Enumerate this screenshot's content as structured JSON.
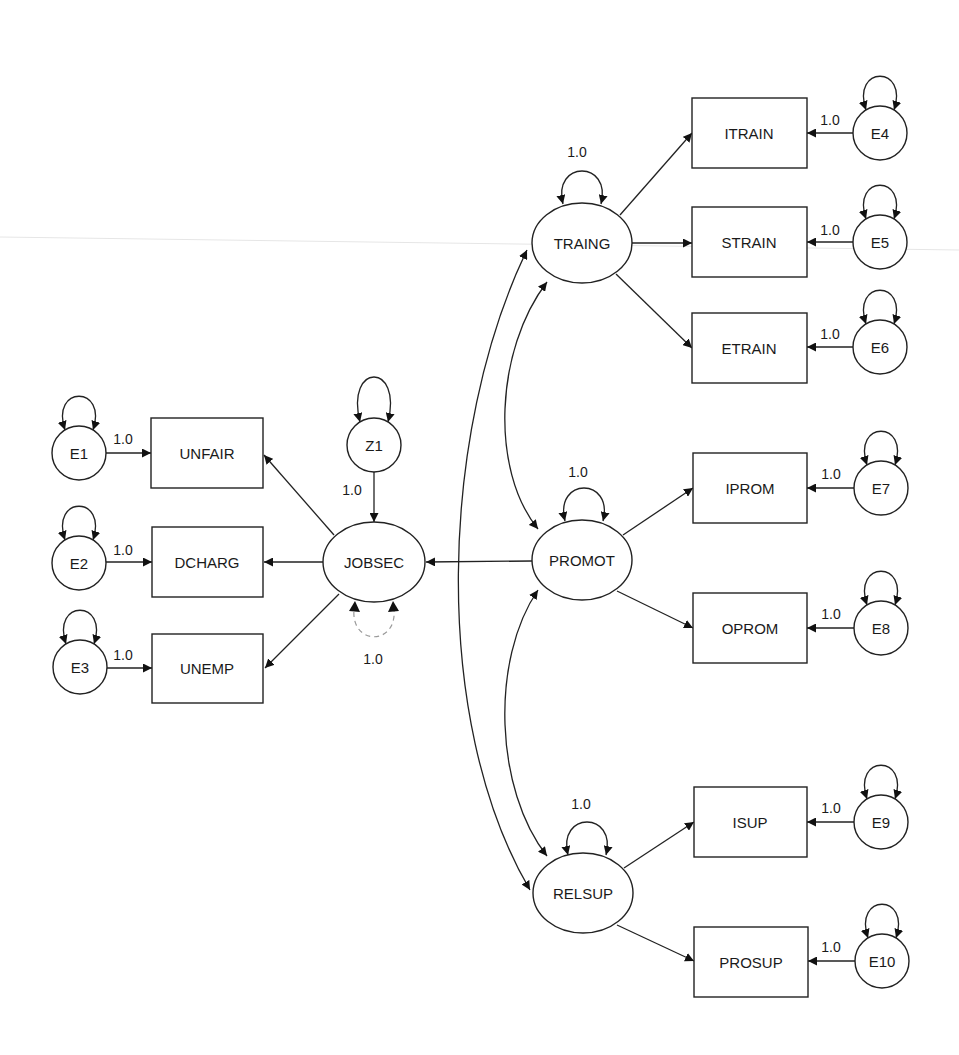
{
  "diagram": {
    "type": "structural-equation-model",
    "colors": {
      "stroke": "#222222",
      "dashed": "#9a9a9a",
      "background": "#ffffff"
    },
    "latent_factors": [
      {
        "id": "JOBSEC",
        "label": "JOBSEC",
        "cx": 374,
        "cy": 562,
        "rx": 51,
        "ry": 40
      },
      {
        "id": "TRAING",
        "label": "TRAING",
        "cx": 582,
        "cy": 243,
        "rx": 50,
        "ry": 40
      },
      {
        "id": "PROMOT",
        "label": "PROMOT",
        "cx": 582,
        "cy": 560,
        "rx": 50,
        "ry": 40
      },
      {
        "id": "RELSUP",
        "label": "RELSUP",
        "cx": 583,
        "cy": 893,
        "rx": 50,
        "ry": 40
      }
    ],
    "indicators": [
      {
        "id": "UNFAIR",
        "label": "UNFAIR",
        "x": 151,
        "y": 418,
        "w": 112,
        "h": 70
      },
      {
        "id": "DCHARG",
        "label": "DCHARG",
        "x": 152,
        "y": 527,
        "w": 111,
        "h": 70
      },
      {
        "id": "UNEMP",
        "label": "UNEMP",
        "x": 152,
        "y": 634,
        "w": 111,
        "h": 69
      },
      {
        "id": "ITRAIN",
        "label": "ITRAIN",
        "x": 692,
        "y": 98,
        "w": 115,
        "h": 70
      },
      {
        "id": "STRAIN",
        "label": "STRAIN",
        "x": 692,
        "y": 207,
        "w": 115,
        "h": 70
      },
      {
        "id": "ETRAIN",
        "label": "ETRAIN",
        "x": 692,
        "y": 313,
        "w": 115,
        "h": 70
      },
      {
        "id": "IPROM",
        "label": "IPROM",
        "x": 693,
        "y": 453,
        "w": 114,
        "h": 70
      },
      {
        "id": "OPROM",
        "label": "OPROM",
        "x": 693,
        "y": 593,
        "w": 114,
        "h": 70
      },
      {
        "id": "ISUP",
        "label": "ISUP",
        "x": 694,
        "y": 787,
        "w": 113,
        "h": 70
      },
      {
        "id": "PROSUP",
        "label": "PROSUP",
        "x": 694,
        "y": 927,
        "w": 114,
        "h": 70
      }
    ],
    "errors": [
      {
        "id": "E1",
        "label": "E1",
        "cx": 79,
        "cy": 453,
        "r": 27,
        "target": "UNFAIR",
        "weight": "1.0"
      },
      {
        "id": "E2",
        "label": "E2",
        "cx": 79,
        "cy": 563,
        "r": 27,
        "target": "DCHARG",
        "weight": "1.0"
      },
      {
        "id": "E3",
        "label": "E3",
        "cx": 80,
        "cy": 667,
        "r": 27,
        "target": "UNEMP",
        "weight": "1.0"
      },
      {
        "id": "E4",
        "label": "E4",
        "cx": 880,
        "cy": 133,
        "r": 27,
        "target": "ITRAIN",
        "weight": "1.0"
      },
      {
        "id": "E5",
        "label": "E5",
        "cx": 880,
        "cy": 242,
        "r": 27,
        "target": "STRAIN",
        "weight": "1.0"
      },
      {
        "id": "E6",
        "label": "E6",
        "cx": 880,
        "cy": 347,
        "r": 27,
        "target": "ETRAIN",
        "weight": "1.0"
      },
      {
        "id": "E7",
        "label": "E7",
        "cx": 881,
        "cy": 488,
        "r": 27,
        "target": "IPROM",
        "weight": "1.0"
      },
      {
        "id": "E8",
        "label": "E8",
        "cx": 881,
        "cy": 628,
        "r": 27,
        "target": "OPROM",
        "weight": "1.0"
      },
      {
        "id": "E9",
        "label": "E9",
        "cx": 881,
        "cy": 822,
        "r": 27,
        "target": "ISUP",
        "weight": "1.0"
      },
      {
        "id": "E10",
        "label": "E10",
        "cx": 882,
        "cy": 961,
        "r": 27,
        "target": "PROSUP",
        "weight": "1.0"
      }
    ],
    "disturbances": [
      {
        "id": "Z1",
        "label": "Z1",
        "cx": 374,
        "cy": 445,
        "r": 27,
        "target": "JOBSEC",
        "weight": "1.0"
      }
    ],
    "factor_variances": [
      {
        "factor": "TRAING",
        "label": "1.0"
      },
      {
        "factor": "PROMOT",
        "label": "1.0"
      },
      {
        "factor": "RELSUP",
        "label": "1.0"
      },
      {
        "factor": "JOBSEC",
        "label": "1.0",
        "style": "dashed"
      }
    ],
    "paths": [
      {
        "from": "JOBSEC",
        "to": "UNFAIR"
      },
      {
        "from": "JOBSEC",
        "to": "DCHARG"
      },
      {
        "from": "JOBSEC",
        "to": "UNEMP"
      },
      {
        "from": "TRAING",
        "to": "ITRAIN"
      },
      {
        "from": "TRAING",
        "to": "STRAIN"
      },
      {
        "from": "TRAING",
        "to": "ETRAIN"
      },
      {
        "from": "PROMOT",
        "to": "IPROM"
      },
      {
        "from": "PROMOT",
        "to": "OPROM"
      },
      {
        "from": "RELSUP",
        "to": "ISUP"
      },
      {
        "from": "RELSUP",
        "to": "PROSUP"
      },
      {
        "from": "PROMOT",
        "to": "JOBSEC"
      }
    ],
    "covariances": [
      {
        "a": "TRAING",
        "b": "PROMOT"
      },
      {
        "a": "PROMOT",
        "b": "RELSUP"
      },
      {
        "a": "TRAING",
        "b": "RELSUP"
      }
    ]
  }
}
